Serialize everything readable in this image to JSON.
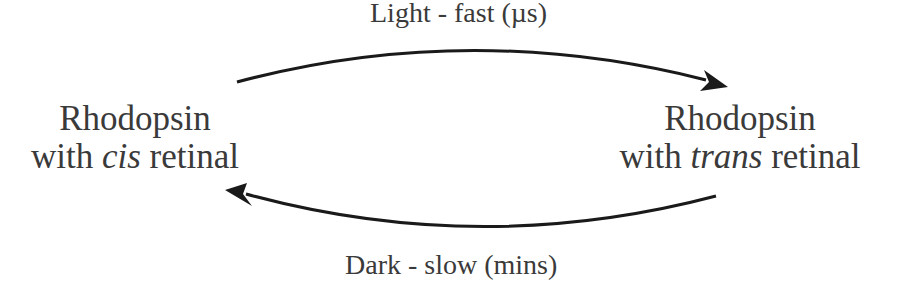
{
  "diagram": {
    "top_label": "Light - fast (µs)",
    "bottom_label": "Dark - slow (mins)",
    "left_node": {
      "line1": "Rhodopsin",
      "line2_prefix": "with ",
      "line2_italic": "cis",
      "line2_suffix": " retinal"
    },
    "right_node": {
      "line1": "Rhodopsin",
      "line2_prefix": "with ",
      "line2_italic": "trans",
      "line2_suffix": " retinal"
    },
    "arrows": [
      {
        "from": "left_node",
        "to": "right_node",
        "label": "Light - fast (µs)"
      },
      {
        "from": "right_node",
        "to": "left_node",
        "label": "Dark - slow (mins)"
      }
    ],
    "colors": {
      "text": "#3a3a3a",
      "arrow": "#1a1a1a",
      "background": "#ffffff"
    }
  }
}
